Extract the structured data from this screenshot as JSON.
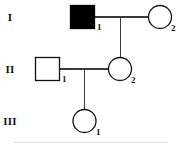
{
  "diagram": {
    "type": "pedigree-chart",
    "background_color": "#ffffff",
    "line_color": "#3a3a3a",
    "symbol_stroke_color": "#111111",
    "affected_fill_color": "#000000",
    "unaffected_fill_color": "#ffffff"
  },
  "generations": [
    {
      "label": "I"
    },
    {
      "label": "II"
    },
    {
      "label": "III"
    }
  ],
  "individuals": [
    {
      "id": "I-1",
      "number": "1",
      "sex": "male",
      "shape": "square",
      "affected": true,
      "generation": "I"
    },
    {
      "id": "I-2",
      "number": "2",
      "sex": "female",
      "shape": "circle",
      "affected": false,
      "generation": "I"
    },
    {
      "id": "II-1",
      "number": "1",
      "sex": "male",
      "shape": "square",
      "affected": false,
      "generation": "II"
    },
    {
      "id": "II-2",
      "number": "2",
      "sex": "female",
      "shape": "circle",
      "affected": false,
      "generation": "II"
    },
    {
      "id": "III-1",
      "number": "1",
      "sex": "female",
      "shape": "circle",
      "affected": false,
      "generation": "III"
    }
  ],
  "relationships": [
    {
      "type": "mating",
      "partners": [
        "I-1",
        "I-2"
      ]
    },
    {
      "type": "offspring",
      "parents": [
        "I-1",
        "I-2"
      ],
      "child": "II-2"
    },
    {
      "type": "mating",
      "partners": [
        "II-1",
        "II-2"
      ]
    },
    {
      "type": "offspring",
      "parents": [
        "II-1",
        "II-2"
      ],
      "child": "III-1"
    }
  ]
}
